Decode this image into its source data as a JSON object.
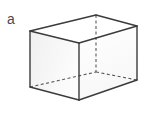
{
  "figure": {
    "label": "a",
    "caption_letter": "a",
    "shape_name": "rectangular-prism",
    "background_color": "#ffffff",
    "edge_color": "#3b3b3b",
    "hidden_edge_color": "#5a5a5a",
    "label_color": "#4a4a4a",
    "face_fill_front": "#fbfbfb",
    "face_fill_left": "#f2f2f2",
    "face_fill_top": "#ffffff",
    "vertices": {
      "front_top": [
        79,
        43
      ],
      "front_bottom": [
        79,
        100
      ],
      "left_top": [
        30,
        31
      ],
      "left_bottom": [
        30,
        87
      ],
      "right_top": [
        137,
        26
      ],
      "right_bottom": [
        137,
        80
      ],
      "back_top": [
        96,
        15
      ],
      "back_bottom": [
        96,
        72
      ]
    },
    "solid_edges": [
      [
        "left_top",
        "front_top"
      ],
      [
        "front_top",
        "right_top"
      ],
      [
        "left_top",
        "back_top"
      ],
      [
        "back_top",
        "right_top"
      ],
      [
        "left_top",
        "left_bottom"
      ],
      [
        "front_top",
        "front_bottom"
      ],
      [
        "right_top",
        "right_bottom"
      ],
      [
        "left_bottom",
        "front_bottom"
      ],
      [
        "front_bottom",
        "right_bottom"
      ]
    ],
    "hidden_edges": [
      [
        "back_top",
        "back_bottom"
      ],
      [
        "left_bottom",
        "back_bottom"
      ],
      [
        "back_bottom",
        "right_bottom"
      ]
    ],
    "dash_pattern": "3,2.5",
    "edge_width": 1.4,
    "hidden_edge_width": 1.1
  }
}
